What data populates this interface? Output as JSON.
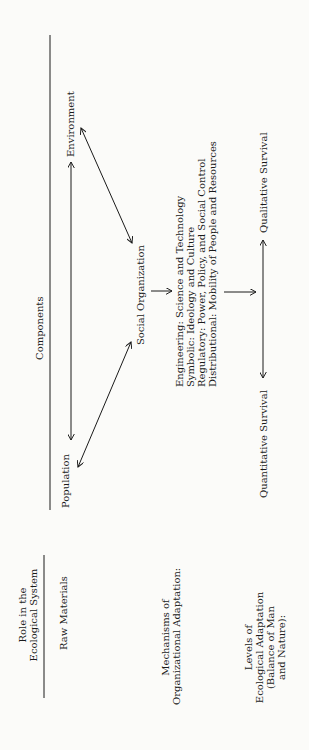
{
  "header": {
    "components_label": "Components",
    "role_label_line1": "Role in the",
    "role_label_line2": "Ecological System"
  },
  "rows": {
    "raw_materials": "Raw Materials",
    "mechanisms_line1": "Mechanisms of",
    "mechanisms_line2": "Organizational Adaptation:",
    "levels_line1": "Levels of",
    "levels_line2": "Ecological Adaptation",
    "levels_line3": "(Balance of Man",
    "levels_line4": "and Nature):"
  },
  "nodes": {
    "population": "Population",
    "environment": "Environment",
    "social_organization": "Social Organization",
    "quantitative_survival": "Quantitative Survival",
    "qualitative_survival": "Qualitative Survival"
  },
  "mechanisms": [
    "Engineering:  Science and Technology",
    "Symbolic:  Ideology and Culture",
    "Regulatory:  Power, Policy, and Social Control",
    "Distributional:  Mobility of People and Resources"
  ],
  "colors": {
    "ink": "#1a1a1a",
    "paper": "#fbfbf9"
  }
}
